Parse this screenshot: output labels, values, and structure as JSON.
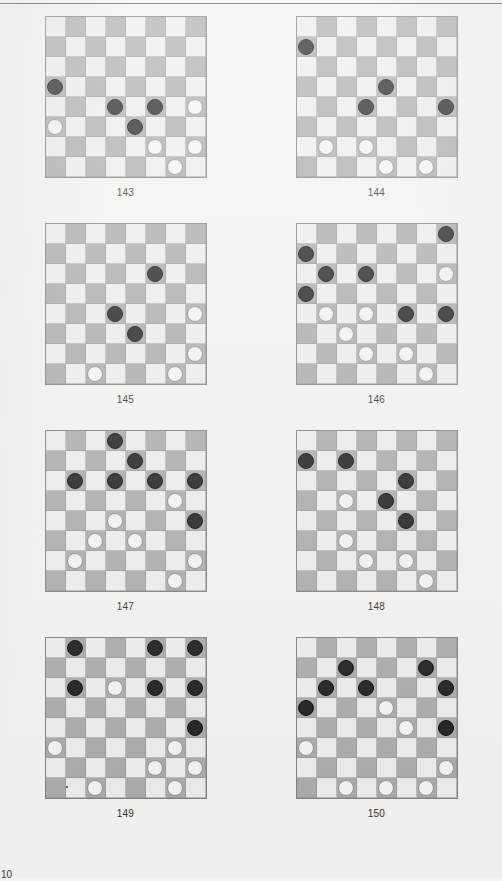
{
  "page": {
    "background_color": "#f2f2f0",
    "footer_text": "10",
    "has_top_rule": true
  },
  "colors": {
    "light_square": "#ececec",
    "dark_square": "#a9a9a9",
    "black_piece": "#1b1b1b",
    "white_piece": "#f3f3f3",
    "board_border": "#7d7d7d",
    "caption_text": "#2b2b2b"
  },
  "board_spec": {
    "rows": 8,
    "cols": 8,
    "light_parity_note": "square is light when (row + col) is even",
    "piece_codes": {
      "b": "black-piece",
      "w": "white-piece",
      "": "empty"
    }
  },
  "boards": [
    {
      "caption": "143",
      "grid": [
        [
          "",
          "",
          "",
          "",
          "",
          "",
          "",
          ""
        ],
        [
          "",
          "",
          "",
          "",
          "",
          "",
          "",
          ""
        ],
        [
          "",
          "",
          "",
          "",
          "",
          "",
          "",
          ""
        ],
        [
          "b",
          "",
          "",
          "",
          "",
          "",
          "",
          ""
        ],
        [
          "",
          "",
          "",
          "b",
          "",
          "b",
          "",
          "w"
        ],
        [
          "w",
          "",
          "",
          "",
          "b",
          "",
          "",
          ""
        ],
        [
          "",
          "",
          "",
          "",
          "",
          "w",
          "",
          "w"
        ],
        [
          "",
          "",
          "",
          "",
          "",
          "",
          "w",
          ""
        ]
      ]
    },
    {
      "caption": "144",
      "grid": [
        [
          "",
          "",
          "",
          "",
          "",
          "",
          "",
          ""
        ],
        [
          "b",
          "",
          "",
          "",
          "",
          "",
          "",
          ""
        ],
        [
          "",
          "",
          "",
          "",
          "",
          "",
          "",
          ""
        ],
        [
          "",
          "",
          "",
          "",
          "b",
          "",
          "",
          ""
        ],
        [
          "",
          "",
          "",
          "b",
          "",
          "",
          "",
          "b"
        ],
        [
          "",
          "",
          "",
          "",
          "",
          "",
          "",
          ""
        ],
        [
          "",
          "w",
          "",
          "w",
          "",
          "",
          "",
          ""
        ],
        [
          "",
          "",
          "",
          "",
          "w",
          "",
          "w",
          ""
        ]
      ]
    },
    {
      "caption": "145",
      "grid": [
        [
          "",
          "",
          "",
          "",
          "",
          "",
          "",
          ""
        ],
        [
          "",
          "",
          "",
          "",
          "",
          "",
          "",
          ""
        ],
        [
          "",
          "",
          "",
          "",
          "",
          "b",
          "",
          ""
        ],
        [
          "",
          "",
          "",
          "",
          "",
          "",
          "",
          ""
        ],
        [
          "",
          "",
          "",
          "b",
          "",
          "",
          "",
          "w"
        ],
        [
          "",
          "",
          "",
          "",
          "b",
          "",
          "",
          ""
        ],
        [
          "",
          "",
          "",
          "",
          "",
          "",
          "",
          "w"
        ],
        [
          "",
          "",
          "w",
          "",
          "",
          "",
          "w",
          ""
        ]
      ]
    },
    {
      "caption": "146",
      "grid": [
        [
          "",
          "",
          "",
          "",
          "",
          "",
          "",
          "b"
        ],
        [
          "b",
          "",
          "",
          "",
          "",
          "",
          "",
          ""
        ],
        [
          "",
          "b",
          "",
          "b",
          "",
          "",
          "",
          "w"
        ],
        [
          "b",
          "",
          "",
          "",
          "",
          "",
          "",
          ""
        ],
        [
          "",
          "w",
          "",
          "w",
          "",
          "b",
          "",
          "b"
        ],
        [
          "",
          "",
          "w",
          "",
          "",
          "",
          "",
          ""
        ],
        [
          "",
          "",
          "",
          "w",
          "",
          "w",
          "",
          ""
        ],
        [
          "",
          "",
          "",
          "",
          "",
          "",
          "w",
          ""
        ]
      ]
    },
    {
      "caption": "147",
      "grid": [
        [
          "",
          "",
          "",
          "b",
          "",
          "",
          "",
          ""
        ],
        [
          "",
          "",
          "",
          "",
          "b",
          "",
          "",
          ""
        ],
        [
          "",
          "b",
          "",
          "b",
          "",
          "b",
          "",
          "b"
        ],
        [
          "",
          "",
          "",
          "",
          "",
          "",
          "w",
          ""
        ],
        [
          "",
          "",
          "",
          "w",
          "",
          "",
          "",
          "b"
        ],
        [
          "",
          "",
          "w",
          "",
          "w",
          "",
          "",
          ""
        ],
        [
          "",
          "w",
          "",
          "",
          "",
          "",
          "",
          "w"
        ],
        [
          "",
          "",
          "",
          "",
          "",
          "",
          "w",
          ""
        ]
      ]
    },
    {
      "caption": "148",
      "grid": [
        [
          "",
          "",
          "",
          "",
          "",
          "",
          "",
          ""
        ],
        [
          "b",
          "",
          "b",
          "",
          "",
          "",
          "",
          ""
        ],
        [
          "",
          "",
          "",
          "",
          "",
          "b",
          "",
          ""
        ],
        [
          "",
          "",
          "w",
          "",
          "b",
          "",
          "",
          ""
        ],
        [
          "",
          "",
          "",
          "",
          "",
          "b",
          "",
          ""
        ],
        [
          "",
          "",
          "w",
          "",
          "",
          "",
          "",
          ""
        ],
        [
          "",
          "",
          "",
          "w",
          "",
          "w",
          "",
          ""
        ],
        [
          "",
          "",
          "",
          "",
          "",
          "",
          "w",
          ""
        ]
      ]
    },
    {
      "caption": "149",
      "grid": [
        [
          "",
          "b",
          "",
          "",
          "",
          "b",
          "",
          "b"
        ],
        [
          "",
          "",
          "",
          "",
          "",
          "",
          "",
          ""
        ],
        [
          "",
          "b",
          "",
          "w",
          "",
          "b",
          "",
          "b"
        ],
        [
          "",
          "",
          "",
          "",
          "",
          "",
          "",
          ""
        ],
        [
          "",
          "",
          "",
          "",
          "",
          "",
          "",
          "b"
        ],
        [
          "w",
          "",
          "",
          "",
          "",
          "",
          "w",
          ""
        ],
        [
          "",
          "",
          "",
          "",
          "",
          "w",
          "",
          "w"
        ],
        [
          "",
          "",
          "w",
          "",
          "",
          "",
          "w",
          ""
        ]
      ]
    },
    {
      "caption": "150",
      "grid": [
        [
          "",
          "",
          "",
          "",
          "",
          "",
          "",
          ""
        ],
        [
          "",
          "",
          "b",
          "",
          "",
          "",
          "b",
          ""
        ],
        [
          "",
          "b",
          "",
          "b",
          "",
          "",
          "",
          "b"
        ],
        [
          "b",
          "",
          "",
          "",
          "w",
          "",
          "",
          ""
        ],
        [
          "",
          "",
          "",
          "",
          "",
          "w",
          "",
          "b"
        ],
        [
          "w",
          "",
          "",
          "",
          "",
          "",
          "",
          ""
        ],
        [
          "",
          "",
          "",
          "",
          "",
          "",
          "",
          "w"
        ],
        [
          "",
          "",
          "w",
          "",
          "w",
          "",
          "w",
          ""
        ]
      ]
    }
  ]
}
